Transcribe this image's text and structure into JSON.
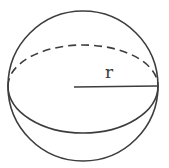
{
  "figure": {
    "name": "sphere-with-radius-diagram",
    "radius_label": "r",
    "stroke_color": "#3d3d3d",
    "background_color": "#ffffff",
    "elements": {
      "outline": "sphere outline circle",
      "equator_back": "dashed upper arc (hidden back half of equator)",
      "equator_front": "solid lower arc (visible front half of equator)",
      "radius": "horizontal radius segment from center to right edge"
    }
  }
}
